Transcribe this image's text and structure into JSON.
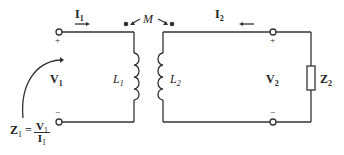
{
  "circuit": {
    "current_primary": {
      "symbol": "I",
      "sub": "1"
    },
    "current_secondary": {
      "symbol": "I",
      "sub": "2"
    },
    "mutual": "M",
    "voltage_primary": {
      "symbol": "V",
      "sub": "1"
    },
    "voltage_secondary": {
      "symbol": "V",
      "sub": "2"
    },
    "inductor_primary": {
      "symbol": "L",
      "sub": "1"
    },
    "inductor_secondary": {
      "symbol": "L",
      "sub": "2"
    },
    "load": {
      "symbol": "Z",
      "sub": "2"
    },
    "input_impedance": {
      "lhs": "Z",
      "lhs_sub": "1",
      "eq": "=",
      "num": "V",
      "num_sub": "1",
      "den": "I",
      "den_sub": "1"
    },
    "plus": "+",
    "minus": "−",
    "colors": {
      "stroke": "#333333"
    }
  }
}
